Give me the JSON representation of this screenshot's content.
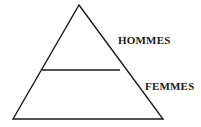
{
  "diagram": {
    "type": "pyramid-diagram",
    "title": "",
    "background_color": "#ffffff",
    "stroke_color": "#1a1a1a",
    "stroke_width": 1.4,
    "canvas": {
      "width": 201,
      "height": 127
    },
    "shape": {
      "name": "triangle",
      "apex": {
        "x": 79,
        "y": 5
      },
      "base_left": {
        "x": 13,
        "y": 119
      },
      "base_right": {
        "x": 163,
        "y": 119
      }
    },
    "divider": {
      "name": "horizontal-divider",
      "y": 70,
      "x_start": 42,
      "x_end": 120
    },
    "segments": [
      {
        "id": "upper",
        "label": "HOMMES",
        "label_x": 118,
        "label_y": 35
      },
      {
        "id": "lower",
        "label": "FEMMES",
        "label_x": 145,
        "label_y": 81
      }
    ]
  },
  "labels": {
    "hommes": "HOMMES",
    "femmes": "FEMMES"
  }
}
